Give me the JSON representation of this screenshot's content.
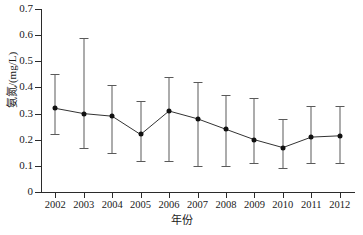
{
  "chart_data": {
    "type": "line",
    "title": "",
    "subtitle": "",
    "xlabel": "年份",
    "ylabel": "氨氮/(mg/L)",
    "categories": [
      "2002",
      "2003",
      "2004",
      "2005",
      "2006",
      "2007",
      "2008",
      "2009",
      "2010",
      "2011",
      "2012"
    ],
    "values": [
      0.32,
      0.3,
      0.29,
      0.22,
      0.31,
      0.28,
      0.24,
      0.2,
      0.17,
      0.21,
      0.215
    ],
    "error_lower": [
      0.22,
      0.17,
      0.15,
      0.12,
      0.12,
      0.1,
      0.1,
      0.11,
      0.09,
      0.11,
      0.11
    ],
    "error_upper": [
      0.45,
      0.59,
      0.41,
      0.35,
      0.44,
      0.42,
      0.37,
      0.36,
      0.28,
      0.33,
      0.33
    ],
    "ylim": [
      0,
      0.7
    ],
    "yticks": [
      "0",
      "0.1",
      "0.2",
      "0.3",
      "0.4",
      "0.5",
      "0.6",
      "0.7"
    ],
    "ytick_values": [
      0,
      0.1,
      0.2,
      0.3,
      0.4,
      0.5,
      0.6,
      0.7
    ],
    "xticks": [
      "2002",
      "2003",
      "2004",
      "2005",
      "2006",
      "2007",
      "2008",
      "2009",
      "2010",
      "2011",
      "2012"
    ],
    "grid": false,
    "legend": null,
    "marker": "filled-circle",
    "error_bars": true,
    "colors": {
      "line": "#333333",
      "marker": "#111111",
      "errorbar": "#5a5a5a",
      "axis": "#2b2b2b",
      "background": "#ffffff"
    }
  }
}
